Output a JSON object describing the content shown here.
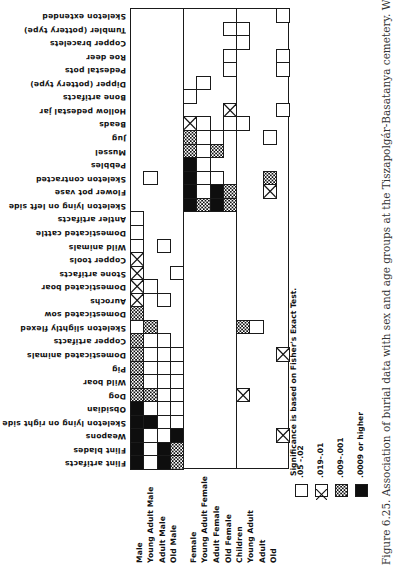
{
  "caption": "Figure 6.25.   Association of burial data with sex and age groups at the Tiszapolgár-Basatanya cemetery. Weapons include:",
  "legend": {
    "title": "Significance is based on Fisher's Exact Test.",
    "items": [
      {
        "style": "empty",
        "label": ".05 -.02"
      },
      {
        "style": "cross",
        "label": ".019-.01"
      },
      {
        "style": "hatch",
        "label": ".009-.001"
      },
      {
        "style": "black",
        "label": ".0009 or higher"
      }
    ]
  },
  "chart_data": {
    "type": "heatmap",
    "title": "Association of burial data with sex and age groups at the Tiszapolgár-Basatanya cemetery",
    "orientation": "rotated 90 degrees on page",
    "columns": [
      "Male",
      "Young Adult Male",
      "Adult Male",
      "Old Male",
      "Female",
      "Young Adult Female",
      "Adult Female",
      "Old Female",
      "Children",
      "Young Adult",
      "Adult",
      "Old"
    ],
    "column_groups": [
      {
        "name": "male",
        "columns": [
          0,
          1,
          2,
          3
        ]
      },
      {
        "name": "female",
        "columns": [
          4,
          5,
          6,
          7
        ]
      },
      {
        "name": "age",
        "columns": [
          8,
          9,
          10,
          11
        ]
      }
    ],
    "rows": [
      "Skeleton extended",
      "Tumbler (pottery type)",
      "Copper bracelets",
      "Roe deer",
      "Pedestal pots",
      "Dipper (pottery type)",
      "Bone artifacts",
      "Hollow pedestal jar",
      "Beads",
      "Jug",
      "Mussel",
      "Pebbles",
      "Skeleton contracted",
      "Flower pot vase",
      "Skeleton lying on left side",
      "Antler artifacts",
      "Domesticated cattle",
      "Wild animals",
      "Copper tools",
      "Stone artifacts",
      "Domesticated boar",
      "Aurochs",
      "Domesticated sow",
      "Skeleton slightly flexed",
      "Copper artifacts",
      "Domesticated animals",
      "Pig",
      "Wild boar",
      "Dog",
      "Obsidian",
      "Skeleton lying on right side",
      "Weapons",
      "Flint blades",
      "Flint artifacts"
    ],
    "significance_levels": {
      "empty": ".05-.02",
      "cross": ".019-.01",
      "hatch": ".009-.001",
      "black": ".0009 or higher"
    },
    "cells": [
      {
        "row": 0,
        "col": 11,
        "level": "empty"
      },
      {
        "row": 1,
        "col": 7,
        "level": "empty"
      },
      {
        "row": 1,
        "col": 8,
        "level": "empty"
      },
      {
        "row": 2,
        "col": 8,
        "level": "empty"
      },
      {
        "row": 3,
        "col": 7,
        "level": "empty"
      },
      {
        "row": 3,
        "col": 11,
        "level": "empty"
      },
      {
        "row": 4,
        "col": 7,
        "level": "empty"
      },
      {
        "row": 4,
        "col": 11,
        "level": "empty"
      },
      {
        "row": 5,
        "col": 5,
        "level": "empty"
      },
      {
        "row": 6,
        "col": 4,
        "level": "empty"
      },
      {
        "row": 7,
        "col": 7,
        "level": "cross"
      },
      {
        "row": 7,
        "col": 11,
        "level": "empty"
      },
      {
        "row": 8,
        "col": 4,
        "level": "cross"
      },
      {
        "row": 8,
        "col": 5,
        "level": "empty"
      },
      {
        "row": 8,
        "col": 7,
        "level": "empty"
      },
      {
        "row": 8,
        "col": 8,
        "level": "empty"
      },
      {
        "row": 9,
        "col": 4,
        "level": "hatch"
      },
      {
        "row": 9,
        "col": 5,
        "level": "empty"
      },
      {
        "row": 9,
        "col": 6,
        "level": "empty"
      },
      {
        "row": 9,
        "col": 10,
        "level": "empty"
      },
      {
        "row": 10,
        "col": 4,
        "level": "hatch"
      },
      {
        "row": 10,
        "col": 5,
        "level": "empty"
      },
      {
        "row": 10,
        "col": 6,
        "level": "hatch"
      },
      {
        "row": 11,
        "col": 4,
        "level": "black"
      },
      {
        "row": 11,
        "col": 5,
        "level": "empty"
      },
      {
        "row": 12,
        "col": 1,
        "level": "empty"
      },
      {
        "row": 12,
        "col": 4,
        "level": "black"
      },
      {
        "row": 12,
        "col": 5,
        "level": "empty"
      },
      {
        "row": 12,
        "col": 6,
        "level": "empty"
      },
      {
        "row": 12,
        "col": 10,
        "level": "hatch"
      },
      {
        "row": 13,
        "col": 4,
        "level": "black"
      },
      {
        "row": 13,
        "col": 5,
        "level": "empty"
      },
      {
        "row": 13,
        "col": 6,
        "level": "black"
      },
      {
        "row": 13,
        "col": 7,
        "level": "hatch"
      },
      {
        "row": 13,
        "col": 10,
        "level": "cross"
      },
      {
        "row": 14,
        "col": 4,
        "level": "black"
      },
      {
        "row": 14,
        "col": 5,
        "level": "hatch"
      },
      {
        "row": 14,
        "col": 6,
        "level": "black"
      },
      {
        "row": 14,
        "col": 7,
        "level": "hatch"
      },
      {
        "row": 15,
        "col": 0,
        "level": "empty"
      },
      {
        "row": 16,
        "col": 0,
        "level": "empty"
      },
      {
        "row": 17,
        "col": 0,
        "level": "empty"
      },
      {
        "row": 17,
        "col": 2,
        "level": "empty"
      },
      {
        "row": 18,
        "col": 0,
        "level": "cross"
      },
      {
        "row": 19,
        "col": 0,
        "level": "cross"
      },
      {
        "row": 19,
        "col": 3,
        "level": "empty"
      },
      {
        "row": 20,
        "col": 0,
        "level": "cross"
      },
      {
        "row": 20,
        "col": 1,
        "level": "empty"
      },
      {
        "row": 21,
        "col": 0,
        "level": "cross"
      },
      {
        "row": 21,
        "col": 2,
        "level": "empty"
      },
      {
        "row": 22,
        "col": 0,
        "level": "hatch"
      },
      {
        "row": 23,
        "col": 0,
        "level": "empty"
      },
      {
        "row": 23,
        "col": 1,
        "level": "hatch"
      },
      {
        "row": 23,
        "col": 8,
        "level": "hatch"
      },
      {
        "row": 23,
        "col": 9,
        "level": "empty"
      },
      {
        "row": 24,
        "col": 0,
        "level": "hatch"
      },
      {
        "row": 24,
        "col": 1,
        "level": "empty"
      },
      {
        "row": 24,
        "col": 2,
        "level": "empty"
      },
      {
        "row": 25,
        "col": 0,
        "level": "hatch"
      },
      {
        "row": 25,
        "col": 1,
        "level": "empty"
      },
      {
        "row": 25,
        "col": 2,
        "level": "empty"
      },
      {
        "row": 25,
        "col": 3,
        "level": "empty"
      },
      {
        "row": 25,
        "col": 11,
        "level": "cross"
      },
      {
        "row": 26,
        "col": 0,
        "level": "hatch"
      },
      {
        "row": 26,
        "col": 1,
        "level": "empty"
      },
      {
        "row": 26,
        "col": 2,
        "level": "empty"
      },
      {
        "row": 26,
        "col": 3,
        "level": "empty"
      },
      {
        "row": 27,
        "col": 0,
        "level": "hatch"
      },
      {
        "row": 27,
        "col": 1,
        "level": "empty"
      },
      {
        "row": 27,
        "col": 2,
        "level": "empty"
      },
      {
        "row": 27,
        "col": 3,
        "level": "empty"
      },
      {
        "row": 28,
        "col": 0,
        "level": "hatch"
      },
      {
        "row": 28,
        "col": 1,
        "level": "hatch"
      },
      {
        "row": 28,
        "col": 2,
        "level": "empty"
      },
      {
        "row": 28,
        "col": 3,
        "level": "empty"
      },
      {
        "row": 28,
        "col": 8,
        "level": "cross"
      },
      {
        "row": 29,
        "col": 0,
        "level": "black"
      },
      {
        "row": 29,
        "col": 1,
        "level": "empty"
      },
      {
        "row": 29,
        "col": 2,
        "level": "empty"
      },
      {
        "row": 29,
        "col": 3,
        "level": "empty"
      },
      {
        "row": 30,
        "col": 0,
        "level": "black"
      },
      {
        "row": 30,
        "col": 1,
        "level": "black"
      },
      {
        "row": 30,
        "col": 2,
        "level": "empty"
      },
      {
        "row": 30,
        "col": 3,
        "level": "empty"
      },
      {
        "row": 31,
        "col": 0,
        "level": "black"
      },
      {
        "row": 31,
        "col": 1,
        "level": "empty"
      },
      {
        "row": 31,
        "col": 2,
        "level": "empty"
      },
      {
        "row": 31,
        "col": 3,
        "level": "black"
      },
      {
        "row": 31,
        "col": 11,
        "level": "cross"
      },
      {
        "row": 32,
        "col": 0,
        "level": "black"
      },
      {
        "row": 32,
        "col": 1,
        "level": "empty"
      },
      {
        "row": 32,
        "col": 2,
        "level": "black"
      },
      {
        "row": 32,
        "col": 3,
        "level": "hatch"
      },
      {
        "row": 33,
        "col": 0,
        "level": "black"
      },
      {
        "row": 33,
        "col": 1,
        "level": "empty"
      },
      {
        "row": 33,
        "col": 2,
        "level": "black"
      },
      {
        "row": 33,
        "col": 3,
        "level": "hatch"
      }
    ],
    "legend_position": "bottom-right (rotated)"
  }
}
